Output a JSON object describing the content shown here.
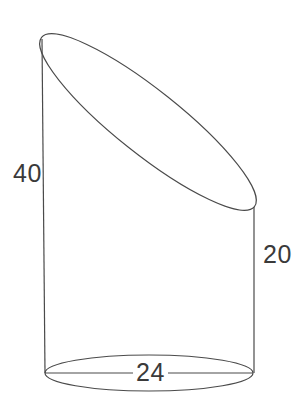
{
  "figure": {
    "kind": "truncated-cylinder-diagram",
    "background_color": "#ffffff",
    "stroke_color": "#4a4a4a",
    "text_color": "#3a3a3a",
    "labels": {
      "left_height": "40",
      "right_height": "20",
      "base_diameter": "24"
    },
    "geometry": {
      "base_ellipse": {
        "cx": 149,
        "cy": 373,
        "rx": 104,
        "ry": 18
      },
      "cut_ellipse": {
        "cx": 148,
        "cy": 122,
        "rx": 136,
        "ry": 32,
        "rotation_deg": 38.5
      },
      "left_edge": {
        "x1": 42,
        "y1": 39,
        "x2": 45,
        "y2": 373
      },
      "right_edge": {
        "x1": 254,
        "y1": 207,
        "x2": 254,
        "y2": 373
      },
      "diameter_line": {
        "x1": 45,
        "y1": 373,
        "x2": 253,
        "y2": 373
      }
    }
  },
  "chart_data": {
    "type": "diagram",
    "title": "",
    "shape": "oblique-cut cylinder",
    "dimensions": [
      {
        "name": "left side height",
        "value": 40,
        "unit": ""
      },
      {
        "name": "right side height",
        "value": 20,
        "unit": ""
      },
      {
        "name": "base diameter",
        "value": 24,
        "unit": ""
      }
    ],
    "annotations": [
      "40",
      "20",
      "24"
    ]
  }
}
